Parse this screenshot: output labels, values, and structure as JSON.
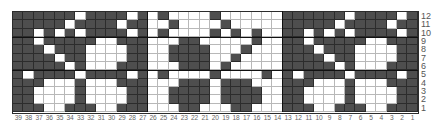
{
  "chart_data": {
    "type": "table",
    "title": "",
    "columns": 39,
    "rows": 12,
    "colors": {
      "D": "#4e4e4e",
      "W": "#ffffff"
    },
    "sections": [
      {
        "name": "left-motif",
        "columns": "39-27"
      },
      {
        "name": "center-motif-inverse",
        "columns": "26-14"
      },
      {
        "name": "right-motif",
        "columns": "13-1"
      }
    ],
    "grid": [
      {
        "row": 12,
        "cells": "DDDDDDWDDDDWDWDWWWWDWWWWWWDDDDDDWDDDDWD"
      },
      {
        "row": 11,
        "cells": "DDDDDWDDDDWDDWWDWWWWDWWWWWDDDDDWDDDDWDD"
      },
      {
        "row": 10,
        "cells": "DDWDWDWDDDDWDWDWWWWDWDWDWWDDWDWDWDDDDWD"
      },
      {
        "row": 9,
        "cells": "DDWDDDDDWWDDDWWWDDWWWWWDWWDDWDDDDDWWDDD"
      },
      {
        "row": 8,
        "cells": "DDDWDDDWWWWDDWWDDDDWWWDWWWDDDWDDDWWWWDD"
      },
      {
        "row": 7,
        "cells": "DDDDWDDWWWWDDWWDDDDWWDWWWWDDDDWDDWWWWDD"
      },
      {
        "row": 6,
        "cells": "DDDDDWDWWWDDDWWWDDDWDWWWWWDDDDDWDWWWDDD"
      },
      {
        "row": 5,
        "cells": "DWDDDDWDDDDWDWDWWWWDWWWWDWDWDDDDWDDDDWD"
      },
      {
        "row": 4,
        "cells": "DDDWWWDWWWDDDWWWDDDWDDDWWWDDDWWWDWWWDDD"
      },
      {
        "row": 3,
        "cells": "DDWWWWDWWWWDDWWDDDDWDDDDWWDDWWWWDWWWWDD"
      },
      {
        "row": 2,
        "cells": "DDWWWWDWWWWDDWWDDDDWDDDDWWDDWWWWDWWWWDD"
      },
      {
        "row": 1,
        "cells": "DDDWWDDDWWDDDWWWDDWWWDDWWWDDDWWDDDWWDDD"
      }
    ],
    "row_labels": [
      "12",
      "11",
      "10",
      "9",
      "8",
      "7",
      "6",
      "5",
      "4",
      "3",
      "2",
      "1"
    ],
    "col_labels": [
      "39",
      "38",
      "37",
      "36",
      "35",
      "34",
      "33",
      "32",
      "31",
      "30",
      "29",
      "28",
      "27",
      "26",
      "25",
      "24",
      "23",
      "22",
      "21",
      "20",
      "19",
      "18",
      "17",
      "16",
      "15",
      "14",
      "13",
      "12",
      "11",
      "10",
      "9",
      "8",
      "7",
      "6",
      "5",
      "4",
      "3",
      "2",
      "1"
    ],
    "xlabel": "",
    "ylabel": ""
  }
}
